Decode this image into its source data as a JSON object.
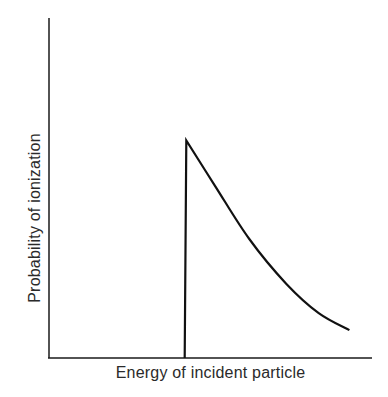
{
  "chart_data": {
    "type": "line",
    "title": "",
    "xlabel": "Energy of incident particle",
    "ylabel": "Probability of ionization",
    "grid": false,
    "legend": null,
    "ticks": {
      "x": [],
      "y": []
    },
    "xlim": [
      0,
      1
    ],
    "ylim": [
      0,
      1
    ],
    "series": [
      {
        "name": "ionization probability",
        "x": [
          0.42,
          0.425,
          0.515,
          0.62,
          0.735,
          0.835,
          0.93
        ],
        "y": [
          0.0,
          0.64,
          0.505,
          0.35,
          0.218,
          0.132,
          0.082
        ]
      }
    ],
    "annotations": [
      "Vertical step at threshold energy (x≈0.42), then monotonic decay"
    ]
  },
  "colors": {
    "axis": "#1a1a1a",
    "curve": "#111111",
    "background": "#ffffff"
  }
}
